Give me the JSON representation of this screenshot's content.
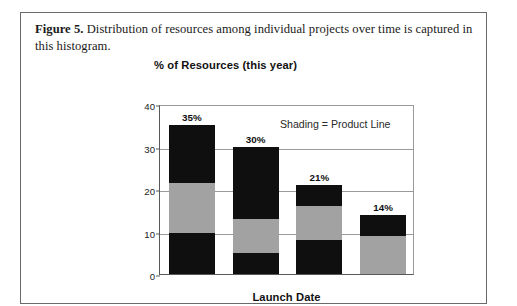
{
  "figure": {
    "caption_label": "Figure 5.",
    "caption_text": " Distribution of resources among individual projects over time is captured in this histogram."
  },
  "chart_data": {
    "type": "bar",
    "subtype": "stacked-bar",
    "title": "% of Resources (this year)",
    "xlabel": "Launch Date",
    "ylabel": "% of Resources (this year)",
    "categories": [
      "Year 1",
      "Year 2",
      "Year 3",
      "Year 4"
    ],
    "ylim": [
      0,
      40
    ],
    "yticks": [
      0,
      10,
      20,
      30,
      40
    ],
    "ytick_labels": [
      "0",
      "10",
      "20",
      "30",
      "40"
    ],
    "grid": true,
    "legend_position": "inside-top-right",
    "annotations": [
      "Shading = Product Line"
    ],
    "totals": [
      35,
      30,
      21,
      14
    ],
    "total_labels": [
      "35%",
      "30%",
      "21%",
      "14%"
    ],
    "series": [
      {
        "name": "segment-bottom",
        "shade": "dark",
        "color": "#100f0f",
        "values": [
          9.7,
          5.0,
          8.0,
          0.0
        ]
      },
      {
        "name": "segment-middle",
        "shade": "light",
        "color": "#a2a2a2",
        "values": [
          11.8,
          8.0,
          8.0,
          9.0
        ]
      },
      {
        "name": "segment-top",
        "shade": "dark",
        "color": "#100f0f",
        "values": [
          13.5,
          17.0,
          5.0,
          5.0
        ]
      }
    ]
  },
  "colors": {
    "dark": "#100f0f",
    "light": "#a2a2a2",
    "axis": "#58595b",
    "grid": "#9a9a9a",
    "border": "#6a6a6a"
  }
}
